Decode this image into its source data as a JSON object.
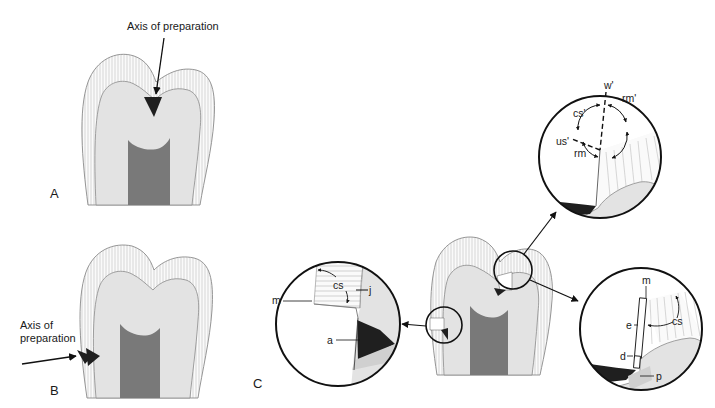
{
  "figure": {
    "panels": [
      {
        "id": "A",
        "label": "A",
        "annotation": "Axis of preparation"
      },
      {
        "id": "B",
        "label": "B",
        "annotation_line1": "Axis of",
        "annotation_line2": "preparation"
      },
      {
        "id": "C",
        "label": "C"
      }
    ],
    "insets": {
      "top": {
        "labels": {
          "w": "w'",
          "rm_prime": "rm'",
          "cs_prime": "cs'",
          "us_prime": "us'",
          "rm": "rm"
        }
      },
      "left": {
        "labels": {
          "cs": "cs",
          "j": "j",
          "m": "m",
          "a": "a"
        }
      },
      "right": {
        "labels": {
          "m": "m",
          "e": "e",
          "cs": "cs",
          "d": "d",
          "p": "p"
        }
      }
    },
    "colors": {
      "enamel": "#fafafa",
      "enamel_hatch": "#b8b8b8",
      "dentin": "#e3e3e3",
      "pulp": "#7a7a7a",
      "lesion": "#1f1f1f",
      "outline": "#8a8a8a",
      "ink": "#111111"
    }
  }
}
